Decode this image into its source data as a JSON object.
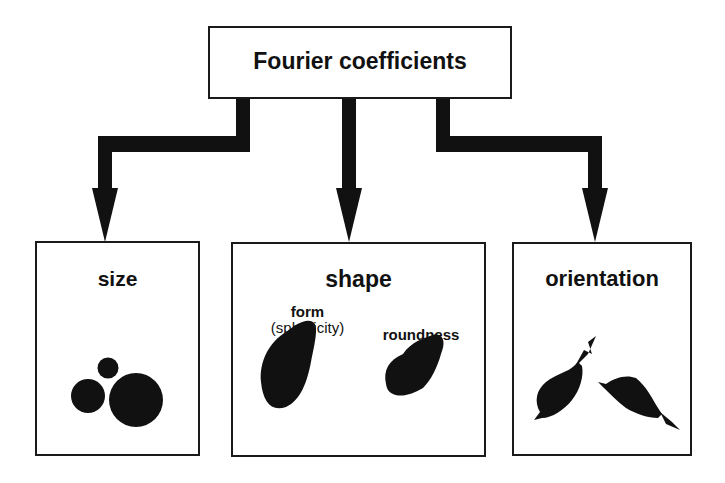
{
  "root": {
    "label": "Fourier coefficients"
  },
  "children": [
    {
      "id": "size",
      "label": "size",
      "illustration": "three-circles-icon"
    },
    {
      "id": "shape",
      "label": "shape",
      "sub_items": [
        {
          "label": "form",
          "note": "(sphericity)",
          "illustration": "elongated-particle-icon"
        },
        {
          "label": "roundness",
          "illustration": "angular-particle-icon"
        }
      ]
    },
    {
      "id": "orientation",
      "label": "orientation",
      "illustration": "oriented-particles-with-arrows-icon"
    }
  ],
  "colors": {
    "ink": "#111111",
    "background": "#ffffff"
  }
}
